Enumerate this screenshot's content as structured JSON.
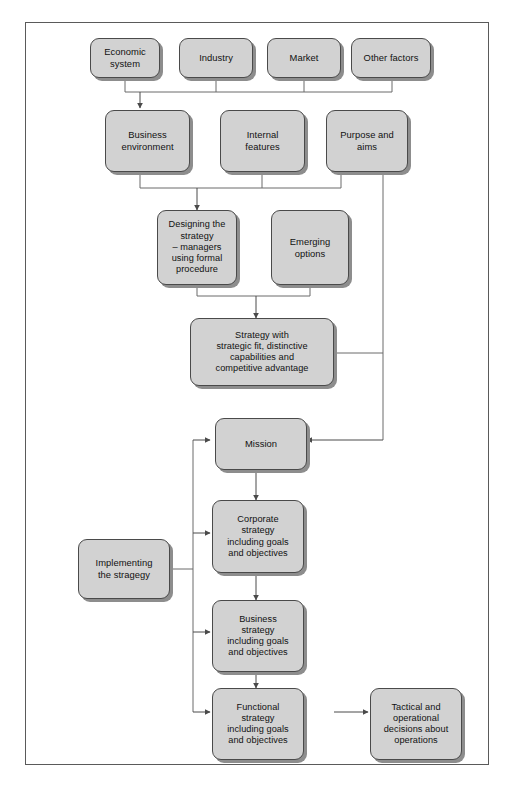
{
  "diagram": {
    "colors": {
      "node_fill": "#d2d2d2",
      "node_border": "#4a4a4a",
      "node_shadow": "#8d8d8d",
      "frame_border": "#5a5a5a",
      "connector": "#6b6b6b",
      "text": "#111111",
      "background": "#ffffff"
    },
    "nodes": [
      {
        "id": "economic-system",
        "label": "Economic\nsystem"
      },
      {
        "id": "industry",
        "label": "Industry"
      },
      {
        "id": "market",
        "label": "Market"
      },
      {
        "id": "other-factors",
        "label": "Other factors"
      },
      {
        "id": "business-environment",
        "label": "Business\nenvironment"
      },
      {
        "id": "internal-features",
        "label": "Internal\nfeatures"
      },
      {
        "id": "purpose-and-aims",
        "label": "Purpose and\naims"
      },
      {
        "id": "designing-the-strategy",
        "label": "Designing the\nstrategy\n– managers\nusing formal\nprocedure"
      },
      {
        "id": "emerging-options",
        "label": "Emerging\noptions"
      },
      {
        "id": "strategy-with-fit",
        "label": "Strategy with\nstrategic fit, distinctive\ncapabilities and\ncompetitive advantage"
      },
      {
        "id": "mission",
        "label": "Mission"
      },
      {
        "id": "implementing-the-strategy",
        "label": "Implementing\nthe stragegy"
      },
      {
        "id": "corporate-strategy",
        "label": "Corporate\nstrategy\nincluding goals\nand objectives"
      },
      {
        "id": "business-strategy",
        "label": "Business\nstrategy\nincluding goals\nand objectives"
      },
      {
        "id": "functional-strategy",
        "label": "Functional\nstrategy\nincluding goals\nand objectives"
      },
      {
        "id": "tactical-operational",
        "label": "Tactical and\noperational\ndecisions about\noperations"
      }
    ]
  }
}
